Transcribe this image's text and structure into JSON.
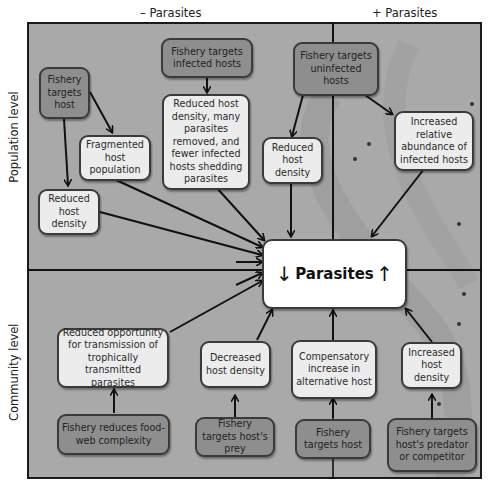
{
  "column_labels": {
    "minus": "– Parasites",
    "plus": "+ Parasites"
  },
  "row_labels": {
    "top": "Population level",
    "bottom": "Community level"
  },
  "center": {
    "label": "Parasites",
    "down_arrow": "↓",
    "up_arrow": "↑"
  },
  "population_level": {
    "fishery_targets_host": "Fishery targets host",
    "fragmented_host_population": "Fragmented host population",
    "reduced_host_density_left": "Reduced host density",
    "fishery_targets_infected_hosts": "Fishery targets infected hosts",
    "reduced_density_many_removed": "Reduced host density, many parasites removed, and fewer infected hosts shedding parasites",
    "fishery_targets_uninfected_hosts": "Fishery targets uninfected hosts",
    "reduced_host_density_mid": "Reduced host density",
    "increased_relative_abundance": "Increased relative abundance of infected hosts"
  },
  "community_level": {
    "reduced_opportunity": "Reduced opportunity for transmission of trophically transmitted parasites",
    "fishery_reduces_foodweb": "Fishery reduces food-web complexity",
    "decreased_host_density": "Decreased host density",
    "fishery_targets_hosts_prey": "Fishery targets host's prey",
    "compensatory_increase": "Compensatory increase in alternative host",
    "fishery_targets_host": "Fishery targets host",
    "increased_host_density": "Increased host density",
    "fishery_targets_predator": "Fishery targets host's predator or competitor"
  },
  "colors": {
    "background_panel": "#a9a9a9",
    "action_box": "#8e8e8e",
    "effect_box": "#ececec",
    "center_box": "#ffffff",
    "lines": "#111111"
  }
}
